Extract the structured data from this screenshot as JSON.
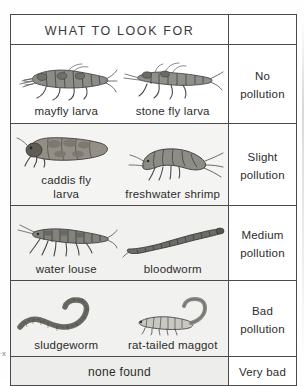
{
  "page": {
    "scan_artifact": "·х",
    "ink_color": "#2c2c2c",
    "rule_color": "#4a4a4a"
  },
  "table": {
    "header": {
      "title": "WHAT TO LOOK FOR",
      "right_header": ""
    },
    "rows": [
      {
        "pollution_level": "No\npollution",
        "specimens": [
          {
            "name": "mayfly larva",
            "icon": "mayfly-larva-illustration"
          },
          {
            "name": "stone fly larva",
            "icon": "stone-fly-larva-illustration"
          }
        ]
      },
      {
        "pollution_level": "Slight\npollution",
        "specimens": [
          {
            "name": "caddis fly\nlarva",
            "icon": "caddis-fly-larva-illustration"
          },
          {
            "name": "freshwater shrimp",
            "icon": "freshwater-shrimp-illustration"
          }
        ]
      },
      {
        "pollution_level": "Medium\npollution",
        "specimens": [
          {
            "name": "water  louse",
            "icon": "water-louse-illustration"
          },
          {
            "name": "bloodworm",
            "icon": "bloodworm-illustration"
          }
        ]
      },
      {
        "pollution_level": "Bad\npollution",
        "specimens": [
          {
            "name": "sludgeworm",
            "icon": "sludgeworm-illustration"
          },
          {
            "name": "rat-tailed maggot",
            "icon": "rat-tailed-maggot-illustration"
          }
        ]
      }
    ],
    "final_row": {
      "specimens_text": "none found",
      "pollution_level": "Very bad"
    }
  }
}
